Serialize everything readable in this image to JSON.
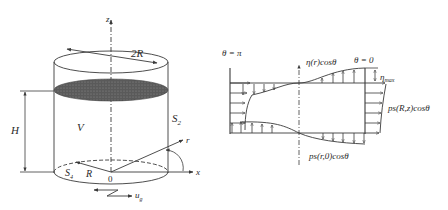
{
  "left_figure": {
    "labels": {
      "z_axis": "z",
      "diameter": "2R",
      "volume": "V",
      "side_surface": "S",
      "side_surface_sub": "2",
      "height": "H",
      "r_axis": "r",
      "x_axis": "x",
      "bottom_surface": "S",
      "bottom_surface_sub": "4",
      "radius": "R",
      "origin": "0",
      "ground_motion": "u",
      "ground_motion_sub": "g"
    }
  },
  "right_figure": {
    "labels": {
      "theta_pi": "θ = π",
      "eta_cos": "η(r)cosθ",
      "theta_zero": "θ = 0",
      "eta_max": "η",
      "eta_max_sub": "max",
      "ps_rz": "ps(R,z)cosθ",
      "ps_r0": "ps(r,0)cosθ"
    }
  },
  "colors": {
    "line": "#3a3a3a",
    "fill_dark": "#555555",
    "text": "#2a2a2a"
  }
}
